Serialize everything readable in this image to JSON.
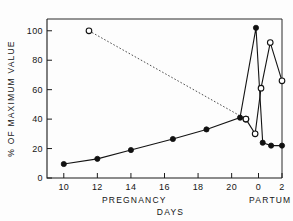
{
  "chart_data": {
    "type": "line",
    "title": "",
    "xlabel": "DAYS",
    "ylabel": "% OF MAXIMUM VALUE",
    "xlim": [
      9,
      23
    ],
    "ylim": [
      0,
      108
    ],
    "grid": false,
    "legend": "none",
    "x_tick_positions": [
      10,
      12,
      14,
      16,
      18,
      20,
      21.6,
      23
    ],
    "x_tick_labels": [
      "10",
      "12",
      "14",
      "16",
      "18",
      "20",
      "0",
      "2"
    ],
    "y_ticks": [
      0,
      20,
      40,
      60,
      80,
      100
    ],
    "y_tick_labels": [
      "0",
      "20",
      "40",
      "60",
      "80",
      "100"
    ],
    "x_group_labels": [
      {
        "text": "PREGNANCY",
        "x": 14.2
      },
      {
        "text": "PARTUM",
        "x": 22.3
      }
    ],
    "series": [
      {
        "name": "filled-circles-solid",
        "marker": "filled-circle",
        "line": "solid",
        "x": [
          10,
          12,
          14,
          16.5,
          18.5,
          20.5,
          21.45,
          21.85,
          22.35,
          23.0
        ],
        "values": [
          9.5,
          13,
          19,
          26.5,
          33,
          41,
          102,
          24,
          22,
          22
        ]
      },
      {
        "name": "open-circles-dotted-lead",
        "marker": "open-circle",
        "line": "dotted",
        "x": [
          11.5,
          20.85
        ],
        "values": [
          100,
          40
        ]
      },
      {
        "name": "open-circles-solid",
        "marker": "open-circle",
        "line": "solid",
        "x": [
          20.85,
          21.4,
          21.75,
          22.3,
          23.0
        ],
        "values": [
          40,
          30,
          61,
          92,
          66
        ]
      }
    ]
  },
  "colors": {
    "ink": "#111111",
    "background": "#ffffff"
  }
}
